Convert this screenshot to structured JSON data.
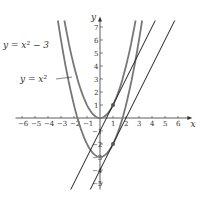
{
  "chart_data": {
    "type": "line",
    "title": "",
    "xlabel": "x",
    "ylabel": "y",
    "xlim": [
      -6.5,
      6.8
    ],
    "ylim": [
      -5.5,
      7.5
    ],
    "x_ticks": [
      -6,
      -5,
      -4,
      -3,
      -2,
      -1,
      1,
      2,
      3,
      4,
      5,
      6
    ],
    "y_ticks": [
      -5,
      -4,
      -3,
      -2,
      -1,
      1,
      2,
      3,
      4,
      5,
      6,
      7
    ],
    "series": [
      {
        "name": "y = x^2",
        "kind": "parabola",
        "a": 1,
        "c": 0,
        "color": "#777777"
      },
      {
        "name": "y = x^2 - 3",
        "kind": "parabola",
        "a": 1,
        "c": -3,
        "color": "#777777"
      },
      {
        "name": "tangent to y = x^2 at (1,1)",
        "kind": "line",
        "slope": 2,
        "intercept": -1,
        "color": "#222222"
      },
      {
        "name": "tangent to y = x^2 - 3 at (1,-2)",
        "kind": "line",
        "slope": 2,
        "intercept": -4,
        "color": "#222222"
      }
    ],
    "points": [
      {
        "x": 1,
        "y": 1
      },
      {
        "x": 1,
        "y": -2
      }
    ],
    "annotations": [
      {
        "text": "y = x² − 3",
        "x": 3,
        "y": 48
      },
      {
        "text": "y = x²",
        "x": 20,
        "y": 82
      }
    ]
  }
}
